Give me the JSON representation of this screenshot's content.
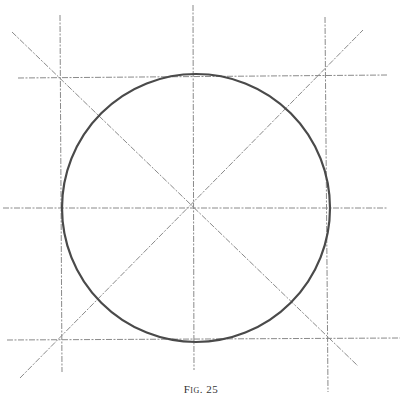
{
  "figure": {
    "caption": "Fig. 25",
    "colors": {
      "guide_line": "#8a8a8a",
      "circle": "#4a4a4a",
      "background": "#ffffff"
    },
    "circle": {
      "cx": 196,
      "cy": 208,
      "r": 134
    },
    "guide_lines": [
      {
        "name": "left-vertical",
        "x1": 60,
        "y1": 15,
        "x2": 62,
        "y2": 372
      },
      {
        "name": "center-vertical",
        "x1": 193,
        "y1": 5,
        "x2": 194,
        "y2": 370
      },
      {
        "name": "right-vertical",
        "x1": 325,
        "y1": 17,
        "x2": 328,
        "y2": 392
      },
      {
        "name": "top-horizontal",
        "x1": 18,
        "y1": 78,
        "x2": 388,
        "y2": 75
      },
      {
        "name": "middle-horizontal",
        "x1": 3,
        "y1": 208,
        "x2": 387,
        "y2": 208
      },
      {
        "name": "bottom-horizontal",
        "x1": 7,
        "y1": 340,
        "x2": 400,
        "y2": 338
      },
      {
        "name": "diagonal-down",
        "x1": 12,
        "y1": 32,
        "x2": 358,
        "y2": 366
      },
      {
        "name": "diagonal-up",
        "x1": 20,
        "y1": 378,
        "x2": 363,
        "y2": 30
      }
    ]
  }
}
